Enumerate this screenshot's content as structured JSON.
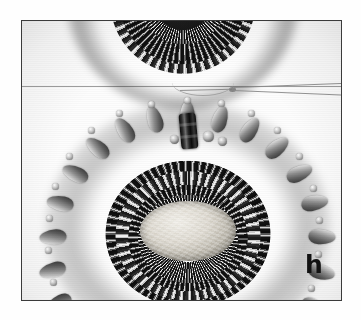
{
  "figure": {
    "panel_label": "h",
    "caption_text": "",
    "medium": "black and white photograph"
  },
  "frame": {
    "border_color": "#3b3b3b",
    "background_color": "#fdfdfd",
    "left": 21,
    "top": 20,
    "width": 321,
    "height": 281
  },
  "page": {
    "background_color": "#ffffff",
    "width": 361,
    "height": 320
  },
  "elements": {
    "top_piece_name": "partial-beaded-arc",
    "main_piece_name": "oval-beaded-bezel",
    "center_stone_name": "oval-cabochon-stone",
    "thread_name": "beading-thread",
    "thread_knot_name": "thread-knot",
    "top_bead_name": "vertical-cylinder-bead",
    "fringe_name": "picot-fringe-petals",
    "horizon_line_name": "background-horizon-line"
  },
  "colors": {
    "bead_dark": "#0d0d0d",
    "bead_highlight": "#f2f2f2",
    "bead_mid": "#8f8f8f",
    "cabochon_light": "#f1efe9",
    "cabochon_shadow": "#7d7a72",
    "thread": "#8a8a8a",
    "label": "#111111"
  },
  "counts": {
    "concentric_rings": 5,
    "fringe_petals": 17,
    "top_arc_rows": 4
  }
}
